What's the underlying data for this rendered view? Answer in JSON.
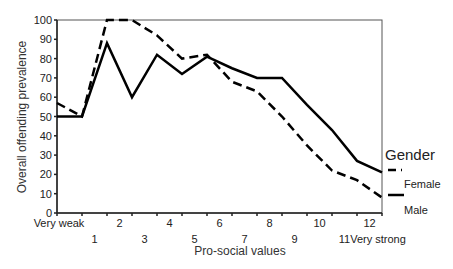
{
  "chart_data": {
    "type": "line",
    "title": "",
    "xlabel": "Pro-social values",
    "ylabel": "Overall offending prevalence",
    "ylim": [
      0,
      100
    ],
    "yticks": [
      0,
      10,
      20,
      30,
      40,
      50,
      60,
      70,
      80,
      90,
      100
    ],
    "grid": false,
    "legend_position": "right",
    "legend_title": "Gender",
    "categories": [
      "Very weak",
      "1",
      "2",
      "3",
      "4",
      "5",
      "6",
      "7",
      "8",
      "9",
      "10",
      "11",
      "12",
      "Very strong"
    ],
    "series": [
      {
        "name": "Female",
        "style": "dashed",
        "color": "#000000",
        "values": [
          57,
          50,
          100,
          100,
          92,
          80,
          82,
          68,
          63,
          50,
          35,
          22,
          17,
          8
        ]
      },
      {
        "name": "Male",
        "style": "solid",
        "color": "#000000",
        "values": [
          50,
          50,
          88,
          60,
          82,
          72,
          81,
          75,
          70,
          70,
          56,
          43,
          27,
          21
        ]
      }
    ]
  }
}
